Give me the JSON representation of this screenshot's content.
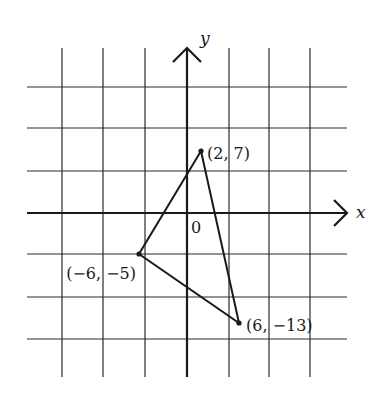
{
  "figure": {
    "type": "coordinate-plane-triangle",
    "axes": {
      "x_label": "x",
      "y_label": "y",
      "origin_label": "0"
    },
    "grid": {
      "vertical_lines_px": [
        62,
        103,
        145,
        229,
        269,
        310
      ],
      "horizontal_lines_px": [
        87,
        128,
        171,
        254,
        297,
        339
      ],
      "y_axis_px": 187,
      "x_axis_px": 213,
      "top_px": 48,
      "bottom_px": 377,
      "left_px": 27,
      "right_px": 347
    },
    "points": [
      {
        "label": "(2, 7)",
        "x": 2,
        "y": 7,
        "px": 201,
        "py": 151,
        "label_x": 207,
        "label_y": 159,
        "anchor": "start"
      },
      {
        "label": "(−6, −5)",
        "x": -6,
        "y": -5,
        "px": 139,
        "py": 254,
        "label_x": 136,
        "label_y": 279,
        "anchor": "end"
      },
      {
        "label": "(6, −13)",
        "x": 6,
        "y": -13,
        "px": 239,
        "py": 323,
        "label_x": 246,
        "label_y": 331,
        "anchor": "start"
      }
    ],
    "colors": {
      "line": "#1a1a1a",
      "grid": "#2a2a2a",
      "background": "#ffffff"
    }
  }
}
